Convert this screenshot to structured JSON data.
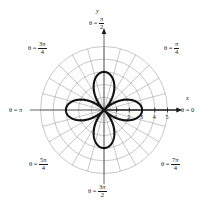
{
  "figure": {
    "kind": "polar-plot",
    "background_color": "#ffffff",
    "curve_color": "#111111",
    "grid_color": "#9a9a9a",
    "axis_color": "#555555",
    "text_color": "#1a1a1a"
  },
  "axes": {
    "x_axis_label": "x",
    "y_axis_label": "y",
    "radial_ticks": [
      "1",
      "2",
      "3",
      "4",
      "5"
    ],
    "radial_tick_values": [
      1,
      2,
      3,
      4,
      5
    ]
  },
  "angle_labels": [
    {
      "name": "theta-0",
      "prefix": "θ =",
      "value": "0",
      "is_fraction": false,
      "numerator": "",
      "denominator": ""
    },
    {
      "name": "theta-pi-4",
      "prefix": "θ =",
      "value": "",
      "is_fraction": true,
      "numerator": "π",
      "denominator": "4"
    },
    {
      "name": "theta-pi-2",
      "prefix": "θ =",
      "value": "",
      "is_fraction": true,
      "numerator": "π",
      "denominator": "2"
    },
    {
      "name": "theta-3pi-4",
      "prefix": "θ =",
      "value": "",
      "is_fraction": true,
      "numerator": "3π",
      "denominator": "4"
    },
    {
      "name": "theta-pi",
      "prefix": "θ =",
      "value": "π",
      "is_fraction": false,
      "numerator": "",
      "denominator": ""
    },
    {
      "name": "theta-5pi-4",
      "prefix": "θ =",
      "value": "",
      "is_fraction": true,
      "numerator": "5π",
      "denominator": "4"
    },
    {
      "name": "theta-3pi-2",
      "prefix": "θ =",
      "value": "",
      "is_fraction": true,
      "numerator": "3π",
      "denominator": "2"
    },
    {
      "name": "theta-7pi-4",
      "prefix": "θ =",
      "value": "",
      "is_fraction": true,
      "numerator": "7π",
      "denominator": "4"
    }
  ],
  "chart_data": {
    "type": "line",
    "coordinate_system": "polar",
    "title": "",
    "xlabel": "x",
    "ylabel": "y",
    "rlim": [
      0,
      5
    ],
    "grid": true,
    "grid_circles": [
      1,
      2,
      3,
      4,
      5
    ],
    "grid_angle_step_deg": 15,
    "legend": "none",
    "series": [
      {
        "name": "four-petal rose",
        "equation": "r = 3 cos(2θ)",
        "petal_count": 4,
        "petal_max_radius": 3,
        "petal_axis_angles_deg": [
          0,
          90,
          180,
          270
        ],
        "theta_deg": [
          0,
          10,
          20,
          30,
          40,
          45,
          50,
          60,
          70,
          80,
          90,
          100,
          110,
          120,
          130,
          135,
          140,
          150,
          160,
          170,
          180,
          190,
          200,
          210,
          220,
          225,
          230,
          240,
          250,
          260,
          270,
          280,
          290,
          300,
          310,
          315,
          320,
          330,
          340,
          350,
          360
        ],
        "r": [
          3.0,
          2.6,
          1.91,
          0.96,
          0.0,
          0.0,
          0.0,
          0.96,
          1.91,
          2.6,
          3.0,
          2.6,
          1.91,
          0.96,
          0.0,
          0.0,
          0.0,
          0.96,
          1.91,
          2.6,
          3.0,
          2.6,
          1.91,
          0.96,
          0.0,
          0.0,
          0.0,
          0.96,
          1.91,
          2.6,
          3.0,
          2.6,
          1.91,
          0.96,
          0.0,
          0.0,
          0.0,
          0.96,
          1.91,
          2.6,
          3.0
        ]
      }
    ],
    "tick_labels_radial": [
      "1",
      "2",
      "3",
      "4",
      "5"
    ],
    "angular_tick_labels": [
      "θ = 0",
      "θ = π/4",
      "θ = π/2",
      "θ = 3π/4",
      "θ = π",
      "θ = 5π/4",
      "θ = 3π/2",
      "θ = 7π/4"
    ]
  }
}
